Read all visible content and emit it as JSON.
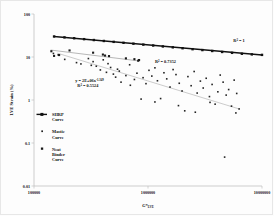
{
  "figure": {
    "background": "#ffffff",
    "border_color": "#e7e7e7"
  },
  "chart_data": {
    "type": "scatter",
    "title": "",
    "subtitle": "",
    "xlabel": "G*",
    "xlabel_subscript": "LVE",
    "ylabel": "LVE Strain (%)",
    "xscale": "log",
    "yscale": "log",
    "xlim": [
      100000,
      10000000
    ],
    "ylim": [
      0.01,
      100
    ],
    "grid": false,
    "legend_position": "inside-left",
    "xticks": [
      100000,
      1000000,
      10000000
    ],
    "xticklabels": [
      "100000",
      "1000000",
      "10000000"
    ],
    "yticks": [
      0.01,
      0.1,
      1,
      10,
      100
    ],
    "yticklabels": [
      "0.01",
      "0.1",
      "1",
      "10",
      "100"
    ],
    "annotations": [
      {
        "name": "r2-shrp",
        "text": "R",
        "sup": "2",
        "tail": " = 1",
        "x": 5600000,
        "y": 22
      },
      {
        "name": "r2-neat",
        "text": "R",
        "sup": "2",
        "tail": " = 0.7352",
        "x": 1150000,
        "y": 7.2
      },
      {
        "name": "eq-mastic",
        "text": "y = 2E+06x",
        "sup": "-1.349",
        "tail": "",
        "x": 230000,
        "y": 2.6
      },
      {
        "name": "r2-mastic",
        "text": "R",
        "sup": "2",
        "tail": " = 0.5524",
        "x": 240000,
        "y": 2.0
      }
    ],
    "series": [
      {
        "name": "SHRP Curve",
        "legend_label_line1": "SHRP",
        "legend_label_line2": "Curve",
        "style": "line-with-markers",
        "color": "#111111",
        "marker": "square",
        "trendline": {
          "x": [
            150000,
            10000000
          ],
          "y": [
            30.0,
            11.2
          ]
        },
        "points": [
          {
            "x": 150000,
            "y": 30.0
          },
          {
            "x": 185000,
            "y": 28.6
          },
          {
            "x": 225000,
            "y": 27.3
          },
          {
            "x": 275000,
            "y": 26.0
          },
          {
            "x": 335000,
            "y": 24.8
          },
          {
            "x": 410000,
            "y": 23.6
          },
          {
            "x": 500000,
            "y": 22.5
          },
          {
            "x": 610000,
            "y": 21.4
          },
          {
            "x": 745000,
            "y": 20.4
          },
          {
            "x": 910000,
            "y": 19.4
          },
          {
            "x": 1110000,
            "y": 18.5
          },
          {
            "x": 1350000,
            "y": 17.6
          },
          {
            "x": 1650000,
            "y": 16.8
          },
          {
            "x": 2010000,
            "y": 16.0
          },
          {
            "x": 2460000,
            "y": 15.2
          },
          {
            "x": 3000000,
            "y": 14.5
          },
          {
            "x": 3660000,
            "y": 13.8
          },
          {
            "x": 4470000,
            "y": 13.1
          },
          {
            "x": 5460000,
            "y": 12.5
          },
          {
            "x": 6660000,
            "y": 11.9
          },
          {
            "x": 8140000,
            "y": 11.5
          },
          {
            "x": 10000000,
            "y": 11.2
          }
        ]
      },
      {
        "name": "Neat Binder Curve",
        "legend_label_line1": "Neat",
        "legend_label_line2": "Binder",
        "legend_label_line3": "Curve",
        "style": "scatter-with-trend",
        "color": "#1a1a1a",
        "marker": "square",
        "trendline": {
          "x": [
            140000,
            830000
          ],
          "y": [
            14.5,
            8.1
          ]
        },
        "points": [
          {
            "x": 142000,
            "y": 13.6
          },
          {
            "x": 150000,
            "y": 10.6
          },
          {
            "x": 166000,
            "y": 11.1
          },
          {
            "x": 205000,
            "y": 14.2
          },
          {
            "x": 330000,
            "y": 12.6
          },
          {
            "x": 402000,
            "y": 11.4
          },
          {
            "x": 420000,
            "y": 10.8
          },
          {
            "x": 455000,
            "y": 10.5
          },
          {
            "x": 640000,
            "y": 9.3
          },
          {
            "x": 760000,
            "y": 8.9
          },
          {
            "x": 820000,
            "y": 8.2
          },
          {
            "x": 835000,
            "y": 8.5
          }
        ]
      },
      {
        "name": "Mastic Curve",
        "legend_label_line1": "Mastic",
        "legend_label_line2": "Curve",
        "style": "scatter-with-trend",
        "color": "#222222",
        "marker": "small-square",
        "trendline": {
          "x": [
            160000,
            6300000
          ],
          "y": [
            12.3,
            0.62
          ]
        },
        "points": [
          {
            "x": 148000,
            "y": 12.1
          },
          {
            "x": 163000,
            "y": 11.2
          },
          {
            "x": 186000,
            "y": 8.8
          },
          {
            "x": 236000,
            "y": 7.4
          },
          {
            "x": 258000,
            "y": 6.9
          },
          {
            "x": 300000,
            "y": 9.2
          },
          {
            "x": 318000,
            "y": 6.4
          },
          {
            "x": 330000,
            "y": 7.8
          },
          {
            "x": 352000,
            "y": 6.1
          },
          {
            "x": 382000,
            "y": 5.0
          },
          {
            "x": 405000,
            "y": 8.6
          },
          {
            "x": 432000,
            "y": 4.4
          },
          {
            "x": 446000,
            "y": 7.0
          },
          {
            "x": 470000,
            "y": 5.7
          },
          {
            "x": 497000,
            "y": 4.0
          },
          {
            "x": 520000,
            "y": 3.4
          },
          {
            "x": 540000,
            "y": 5.2
          },
          {
            "x": 560000,
            "y": 4.7
          },
          {
            "x": 580000,
            "y": 2.6
          },
          {
            "x": 640000,
            "y": 3.7
          },
          {
            "x": 690000,
            "y": 6.6
          },
          {
            "x": 700000,
            "y": 2.2
          },
          {
            "x": 760000,
            "y": 3.0
          },
          {
            "x": 800000,
            "y": 4.2
          },
          {
            "x": 870000,
            "y": 1.05
          },
          {
            "x": 905000,
            "y": 3.3
          },
          {
            "x": 960000,
            "y": 2.4
          },
          {
            "x": 1020000,
            "y": 4.9
          },
          {
            "x": 1080000,
            "y": 3.6
          },
          {
            "x": 1150000,
            "y": 5.6
          },
          {
            "x": 1210000,
            "y": 2.8
          },
          {
            "x": 1290000,
            "y": 1.08
          },
          {
            "x": 1380000,
            "y": 4.3
          },
          {
            "x": 1460000,
            "y": 3.1
          },
          {
            "x": 1560000,
            "y": 2.0
          },
          {
            "x": 1660000,
            "y": 5.1
          },
          {
            "x": 1760000,
            "y": 3.9
          },
          {
            "x": 1880000,
            "y": 2.45
          },
          {
            "x": 1990000,
            "y": 1.62
          },
          {
            "x": 2100000,
            "y": 0.56
          },
          {
            "x": 2240000,
            "y": 3.5
          },
          {
            "x": 2390000,
            "y": 2.15
          },
          {
            "x": 2540000,
            "y": 4.6
          },
          {
            "x": 2700000,
            "y": 1.45
          },
          {
            "x": 2880000,
            "y": 2.75
          },
          {
            "x": 3050000,
            "y": 1.9
          },
          {
            "x": 3240000,
            "y": 3.2
          },
          {
            "x": 3460000,
            "y": 1.2
          },
          {
            "x": 3650000,
            "y": 2.3
          },
          {
            "x": 3880000,
            "y": 0.8
          },
          {
            "x": 4100000,
            "y": 1.55
          },
          {
            "x": 4300000,
            "y": 3.8
          },
          {
            "x": 4560000,
            "y": 2.6
          },
          {
            "x": 4700000,
            "y": 0.047
          },
          {
            "x": 4850000,
            "y": 1.3
          },
          {
            "x": 5100000,
            "y": 1.75
          },
          {
            "x": 5400000,
            "y": 0.72
          },
          {
            "x": 5700000,
            "y": 2.9
          },
          {
            "x": 6000000,
            "y": 1.42
          },
          {
            "x": 6300000,
            "y": 0.62
          },
          {
            "x": 5900000,
            "y": 0.5
          },
          {
            "x": 2600000,
            "y": 0.52
          },
          {
            "x": 1850000,
            "y": 0.74
          },
          {
            "x": 1150000,
            "y": 0.9
          },
          {
            "x": 3500000,
            "y": 0.88
          }
        ]
      }
    ]
  },
  "legend": {
    "items": [
      {
        "name": "legend-shrp",
        "lines": [
          "SHRP",
          "Curve"
        ],
        "marker": "line-square",
        "color": "#111111"
      },
      {
        "name": "legend-mastic",
        "lines": [
          "Mastic",
          "Curve"
        ],
        "marker": "small-square",
        "color": "#222222"
      },
      {
        "name": "legend-neat",
        "lines": [
          "Neat",
          "Binder",
          "Curve"
        ],
        "marker": "square",
        "color": "#1a1a1a"
      }
    ]
  }
}
